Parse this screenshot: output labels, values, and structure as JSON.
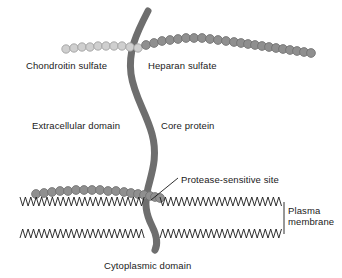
{
  "figure": {
    "background_color": "#ffffff",
    "width": 342,
    "height": 278
  },
  "labels": {
    "chondroitin_sulfate": "Chondroitin sulfate",
    "heparan_sulfate": "Heparan sulfate",
    "extracellular_domain": "Extracellular domain",
    "core_protein": "Core protein",
    "protease_sensitive_site": "Protease-sensitive site",
    "plasma_membrane_line1": "Plasma",
    "plasma_membrane_line2": "membrane",
    "cytoplasmic_domain": "Cytoplasmic domain"
  },
  "colors": {
    "core_protein": "#6e6e6e",
    "chondroitin_bead_fill": "#cfcfcf",
    "chondroitin_bead_stroke": "#9a9a9a",
    "heparan_bead_fill": "#8f8f8f",
    "heparan_bead_stroke": "#6f6f6f",
    "membrane_line": "#1a1a1a",
    "text": "#1a1a1a",
    "leader_line": "#1a1a1a"
  },
  "structures": {
    "core_protein": {
      "name": "Core protein",
      "path": "M148,11 C136,34 128,52 131,74 C134,96 146,112 152,134 C158,156 152,172 148,188 C144,204 146,214 152,226 C157,236 158,244 155,250",
      "stroke_width": 7
    },
    "chondroitin_sulfate_chain": {
      "name": "Chondroitin sulfate",
      "bead_count": 10,
      "bead_radius": 4.2,
      "bead_fill": "#cfcfcf",
      "points": [
        [
          66,
          49
        ],
        [
          74,
          48
        ],
        [
          82,
          47
        ],
        [
          90,
          47
        ],
        [
          98,
          46
        ],
        [
          106,
          46
        ],
        [
          114,
          46
        ],
        [
          122,
          46
        ],
        [
          130,
          47
        ],
        [
          138,
          48
        ]
      ]
    },
    "heparan_sulfate_chain_upper": {
      "name": "Heparan sulfate",
      "bead_count": 23,
      "bead_radius": 4.4,
      "bead_fill": "#8f8f8f",
      "points": [
        [
          146,
          45
        ],
        [
          154,
          43
        ],
        [
          162,
          41
        ],
        [
          170,
          40
        ],
        [
          178,
          39
        ],
        [
          186,
          38
        ],
        [
          194,
          38
        ],
        [
          202,
          38
        ],
        [
          210,
          39
        ],
        [
          218,
          40
        ],
        [
          226,
          41
        ],
        [
          234,
          42
        ],
        [
          241,
          43
        ],
        [
          248,
          44
        ],
        [
          255,
          45
        ],
        [
          262,
          46
        ],
        [
          269,
          47
        ],
        [
          276,
          48
        ],
        [
          283,
          49
        ],
        [
          290,
          50
        ],
        [
          297,
          51
        ],
        [
          304,
          52
        ],
        [
          311,
          53
        ]
      ]
    },
    "heparan_sulfate_chain_lower": {
      "name": "Heparan sulfate (membrane proximal)",
      "bead_count": 18,
      "bead_radius": 4.4,
      "bead_fill": "#8f8f8f",
      "points": [
        [
          36,
          194
        ],
        [
          44,
          193
        ],
        [
          52,
          192
        ],
        [
          60,
          191
        ],
        [
          68,
          191
        ],
        [
          76,
          190
        ],
        [
          84,
          190
        ],
        [
          92,
          190
        ],
        [
          100,
          190
        ],
        [
          108,
          191
        ],
        [
          116,
          191
        ],
        [
          124,
          192
        ],
        [
          131,
          193
        ],
        [
          138,
          194
        ],
        [
          144,
          195
        ],
        [
          150,
          196
        ],
        [
          155,
          197
        ],
        [
          160,
          198
        ]
      ]
    },
    "plasma_membrane": {
      "name": "Plasma membrane",
      "type": "lipid-bilayer-zigzag",
      "left": 20,
      "right": 283,
      "upper_leaflet_y": 206,
      "lower_leaflet_y": 229,
      "zigzag_period": 5.4,
      "zigzag_amplitude": 9,
      "gap_start": 146,
      "gap_end": 160
    },
    "protease_leader_line": {
      "name": "Protease-sensitive site leader",
      "from": [
        178,
        178
      ],
      "to": [
        151,
        200
      ]
    },
    "plasma_membrane_leader": {
      "name": "Plasma membrane brace",
      "x": 284,
      "y_top": 202,
      "y_bottom": 234
    }
  }
}
